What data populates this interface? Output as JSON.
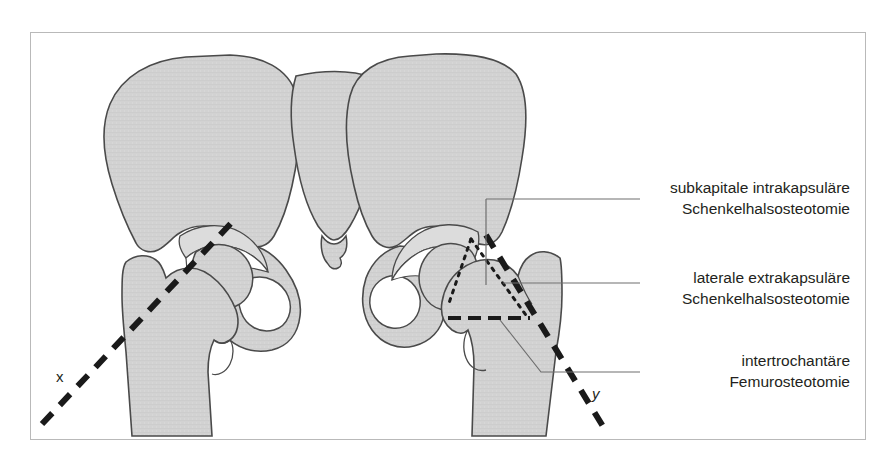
{
  "figure": {
    "kind": "anatomical-diagram",
    "frame_border_color": "#b9b9b9",
    "background_color": "#ffffff"
  },
  "colors": {
    "bone_fill": "#d2d2d2",
    "bone_fill_light": "#dcdcdc",
    "bone_outline": "#4a4a4a",
    "cut_line": "#1a1a1a",
    "leader_line": "#6f6f6f",
    "text": "#231f20"
  },
  "labels": [
    {
      "id": "subcapital",
      "line1": "subkapitale intrakapsuläre",
      "line2": "Schenkelhalsosteotomie"
    },
    {
      "id": "lateral-extracapsular",
      "line1": "laterale extrakapsuläre",
      "line2": "Schenkelhalsosteotomie"
    },
    {
      "id": "intertrochanteric",
      "line1": "intertrochantäre",
      "line2": "Femurosteotomie"
    }
  ],
  "axis_markers": [
    {
      "id": "x",
      "text": "x"
    },
    {
      "id": "y",
      "text": "y"
    }
  ],
  "osteotomy_lines": [
    {
      "id": "subcapital-cut",
      "style": "fine-dotted"
    },
    {
      "id": "lateral-extracapsular-cut",
      "style": "fine-dotted"
    },
    {
      "id": "intertrochanteric-cut",
      "style": "bold-dashed"
    },
    {
      "id": "axis-x-dashed",
      "style": "bold-dashed"
    },
    {
      "id": "axis-y-dashed",
      "style": "bold-dashed"
    }
  ]
}
